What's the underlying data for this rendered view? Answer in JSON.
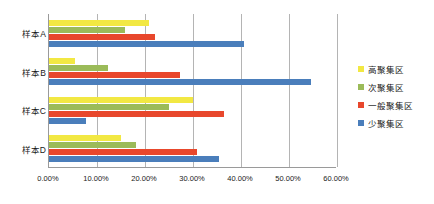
{
  "chart_data": {
    "type": "bar",
    "orientation": "horizontal",
    "title": "",
    "xlabel": "",
    "ylabel": "",
    "xlim": [
      0,
      60
    ],
    "xtick_labels": [
      "0.00%",
      "10.00%",
      "20.00%",
      "30.00%",
      "40.00%",
      "50.00%",
      "60.00%"
    ],
    "xtick_values": [
      0,
      10,
      20,
      30,
      40,
      50,
      60
    ],
    "grid": "vertical",
    "legend_position": "right",
    "categories": [
      "样本A",
      "样本B",
      "样本C",
      "样本D"
    ],
    "series": [
      {
        "name": "高聚集区",
        "color": "#F2E843",
        "values": [
          20.8,
          5.5,
          30.0,
          15.0
        ]
      },
      {
        "name": "次聚集区",
        "color": "#9BBB59",
        "values": [
          15.8,
          12.3,
          25.0,
          18.2
        ]
      },
      {
        "name": "一般聚集区",
        "color": "#E8472C",
        "values": [
          22.0,
          27.3,
          36.5,
          30.8
        ]
      },
      {
        "name": "少聚集区",
        "color": "#4A7EBB",
        "values": [
          40.6,
          54.5,
          7.8,
          35.5
        ]
      }
    ]
  },
  "axis": {
    "tick_0": "0.00%",
    "tick_1": "10.00%",
    "tick_2": "20.00%",
    "tick_3": "30.00%",
    "tick_4": "40.00%",
    "tick_5": "50.00%",
    "tick_6": "60.00%"
  },
  "categories": {
    "c0": "样本A",
    "c1": "样本B",
    "c2": "样本C",
    "c3": "样本D"
  },
  "legend": {
    "items": [
      {
        "label": "高聚集区",
        "color": "#F2E843"
      },
      {
        "label": "次聚集区",
        "color": "#9BBB59"
      },
      {
        "label": "一般聚集区",
        "color": "#E8472C"
      },
      {
        "label": "少聚集区",
        "color": "#4A7EBB"
      }
    ]
  }
}
